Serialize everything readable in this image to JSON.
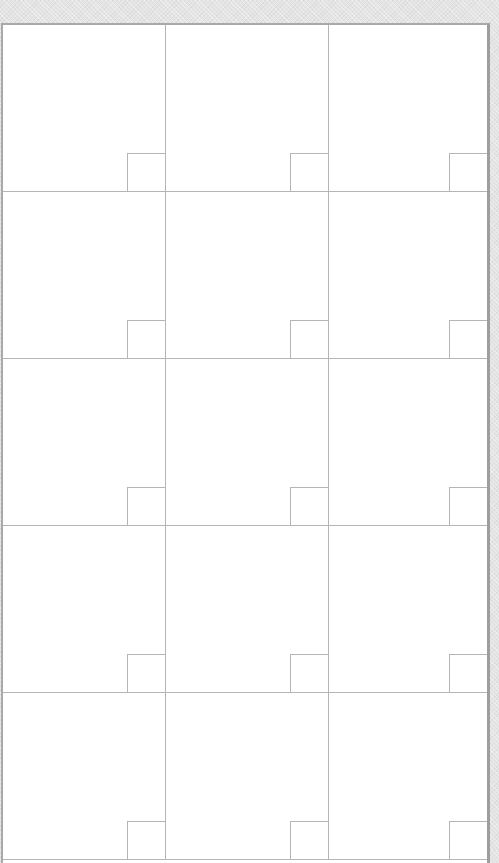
{
  "grid": {
    "columns": 3,
    "rows": 5,
    "cells": [
      {
        "day": ""
      },
      {
        "day": ""
      },
      {
        "day": ""
      },
      {
        "day": ""
      },
      {
        "day": ""
      },
      {
        "day": ""
      },
      {
        "day": ""
      },
      {
        "day": ""
      },
      {
        "day": ""
      },
      {
        "day": ""
      },
      {
        "day": ""
      },
      {
        "day": ""
      },
      {
        "day": ""
      },
      {
        "day": ""
      },
      {
        "day": ""
      }
    ]
  },
  "colors": {
    "background": "#e4e4e4",
    "grid_line": "#b5b5b5",
    "cell_fill": "#ffffff"
  }
}
